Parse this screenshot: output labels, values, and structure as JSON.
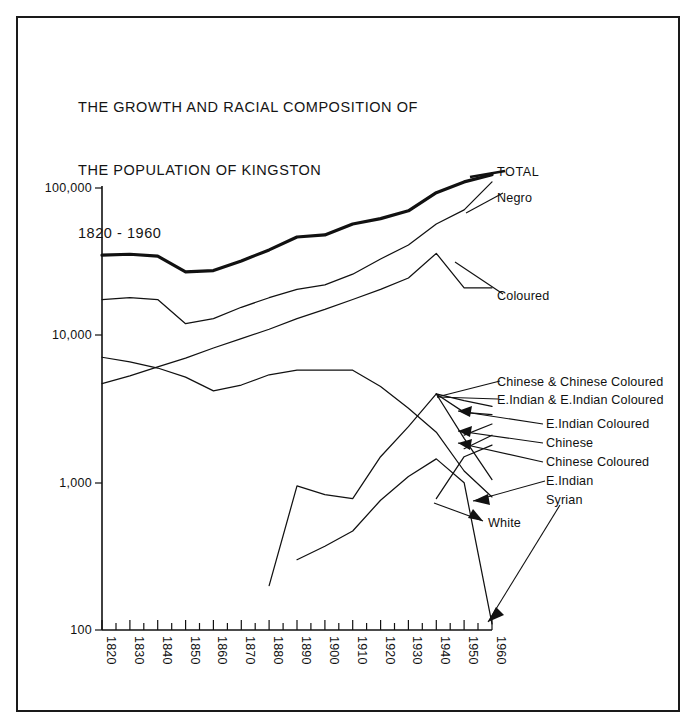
{
  "page": {
    "background": "#ffffff",
    "ink": "#111111",
    "frame": {
      "name": "page-border"
    }
  },
  "title": {
    "line1": "THE GROWTH AND RACIAL COMPOSITION OF",
    "line2": "THE POPULATION OF KINGSTON",
    "line3": "1820 - 1960"
  },
  "chart_data": {
    "type": "line",
    "title": "THE GROWTH AND RACIAL COMPOSITION OF THE POPULATION OF KINGSTON 1820 - 1960",
    "xlabel": "",
    "ylabel": "",
    "yscale": "log",
    "ylim": [
      100,
      100000
    ],
    "xlim": [
      1820,
      1960
    ],
    "grid": false,
    "legend": "inline-labels-right",
    "ytick_labels": [
      "100",
      "1,000",
      "10,000",
      "100,000"
    ],
    "ytick_values": [
      100,
      1000,
      10000,
      100000
    ],
    "xtick_labels": [
      "1820",
      "1830",
      "1840",
      "1850",
      "1860",
      "1870",
      "1880",
      "1890",
      "1900",
      "1910",
      "1920",
      "1930",
      "1940",
      "1950",
      "1960"
    ],
    "x": [
      1820,
      1830,
      1840,
      1850,
      1860,
      1870,
      1880,
      1890,
      1900,
      1910,
      1920,
      1930,
      1940,
      1950,
      1960
    ],
    "series": [
      {
        "name": "TOTAL",
        "label": "TOTAL",
        "emphasis": "thick",
        "values": [
          35000,
          35500,
          34500,
          27000,
          27500,
          32000,
          38000,
          46500,
          48000,
          57000,
          62000,
          70000,
          93000,
          110000,
          123000
        ]
      },
      {
        "name": "Negro",
        "label": "Negro",
        "emphasis": "thin",
        "values": [
          17500,
          18000,
          17500,
          12000,
          13000,
          15500,
          18000,
          20500,
          22000,
          26000,
          33000,
          41000,
          57000,
          71000,
          110000
        ]
      },
      {
        "name": "Coloured",
        "label": "Coloured",
        "emphasis": "thin",
        "values": [
          4700,
          5300,
          6100,
          7000,
          8200,
          9500,
          11000,
          13000,
          15000,
          17500,
          20500,
          24500,
          36000,
          21000,
          21000
        ]
      },
      {
        "name": "White",
        "label": "White",
        "emphasis": "thin",
        "values": [
          7100,
          6600,
          6000,
          5200,
          4200,
          4600,
          5400,
          5800,
          5800,
          5800,
          4500,
          3200,
          2200,
          1200,
          800
        ]
      },
      {
        "name": "Chinese & Chinese Coloured",
        "label": "Chinese & Chinese Coloured",
        "emphasis": "thin",
        "values": [
          null,
          null,
          null,
          null,
          null,
          null,
          null,
          null,
          null,
          null,
          null,
          null,
          4000,
          3600,
          3300
        ]
      },
      {
        "name": "E.Indian & E.Indian Coloured",
        "label": "E.Indian & E.Indian Coloured",
        "emphasis": "thin",
        "values": [
          null,
          null,
          null,
          null,
          null,
          null,
          null,
          null,
          null,
          null,
          null,
          null,
          4000,
          3000,
          2900
        ]
      },
      {
        "name": "E.Indian Coloured",
        "label": "E.Indian Coloured",
        "emphasis": "thin",
        "values": [
          null,
          null,
          null,
          null,
          null,
          null,
          null,
          null,
          null,
          null,
          null,
          null,
          null,
          2100,
          2500
        ]
      },
      {
        "name": "Chinese",
        "label": "Chinese",
        "emphasis": "thin",
        "values": [
          null,
          null,
          null,
          null,
          null,
          null,
          null,
          null,
          null,
          null,
          null,
          null,
          null,
          1700,
          2100
        ]
      },
      {
        "name": "Chinese Coloured",
        "label": "Chinese Coloured",
        "emphasis": "thin",
        "values": [
          null,
          null,
          null,
          null,
          null,
          null,
          null,
          null,
          null,
          null,
          null,
          null,
          780,
          1500,
          1800
        ]
      },
      {
        "name": "E.Indian",
        "label": "E.Indian",
        "emphasis": "thin",
        "values": [
          null,
          null,
          null,
          null,
          null,
          null,
          200,
          950,
          830,
          780,
          1500,
          2400,
          4000,
          2000,
          1050
        ]
      },
      {
        "name": "Syrian",
        "label": "Syrian",
        "emphasis": "thin",
        "values": [
          null,
          null,
          null,
          null,
          null,
          null,
          null,
          300,
          370,
          470,
          760,
          1100,
          1450,
          1000,
          110
        ]
      }
    ],
    "annotations": [
      {
        "text": "TOTAL",
        "name": "series-label-total"
      },
      {
        "text": "Negro",
        "name": "series-label-negro"
      },
      {
        "text": "Coloured",
        "name": "series-label-coloured"
      },
      {
        "text": "Chinese & Chinese Coloured",
        "name": "series-label-chinese-and-chinese-coloured"
      },
      {
        "text": "E.Indian & E.Indian Coloured",
        "name": "series-label-eindian-and-eindian-coloured"
      },
      {
        "text": "E.Indian  Coloured",
        "name": "series-label-eindian-coloured"
      },
      {
        "text": "Chinese",
        "name": "series-label-chinese"
      },
      {
        "text": "Chinese Coloured",
        "name": "series-label-chinese-coloured"
      },
      {
        "text": "E.Indian",
        "name": "series-label-eindian"
      },
      {
        "text": "Syrian",
        "name": "series-label-syrian"
      },
      {
        "text": "White",
        "name": "series-label-white"
      }
    ]
  },
  "axes": {
    "y_ticks": [
      {
        "label": "100,000",
        "value": 100000
      },
      {
        "label": "10,000",
        "value": 10000
      },
      {
        "label": "1,000",
        "value": 1000
      },
      {
        "label": "100",
        "value": 100
      }
    ],
    "x_ticks": [
      {
        "label": "1820"
      },
      {
        "label": "1830"
      },
      {
        "label": "1840"
      },
      {
        "label": "1850"
      },
      {
        "label": "1860"
      },
      {
        "label": "1870"
      },
      {
        "label": "1880"
      },
      {
        "label": "1890"
      },
      {
        "label": "1900"
      },
      {
        "label": "1910"
      },
      {
        "label": "1920"
      },
      {
        "label": "1930"
      },
      {
        "label": "1940"
      },
      {
        "label": "1950"
      },
      {
        "label": "1960"
      }
    ]
  },
  "labels": {
    "total": "TOTAL",
    "negro": "Negro",
    "coloured": "Coloured",
    "chinese_and_chinese_coloured": "Chinese & Chinese Coloured",
    "eindian_and_eindian_coloured": "E.Indian & E.Indian Coloured",
    "eindian_coloured": "E.Indian  Coloured",
    "chinese": "Chinese",
    "chinese_coloured": "Chinese Coloured",
    "eindian": "E.Indian",
    "syrian": "Syrian",
    "white": "White"
  }
}
